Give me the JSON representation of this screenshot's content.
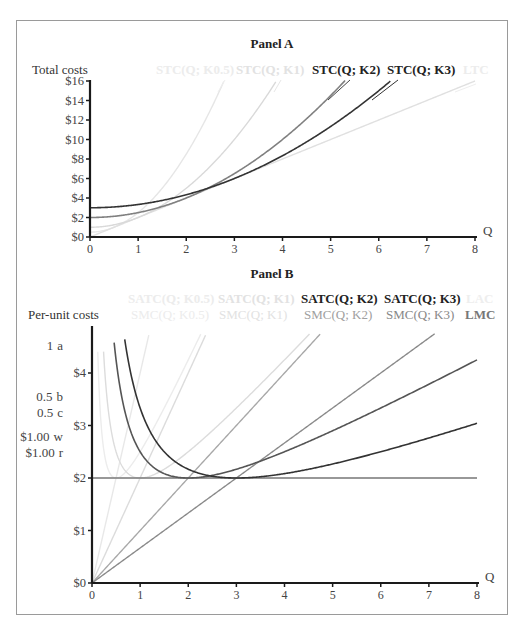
{
  "chart_data": [
    {
      "type": "line",
      "title": "Panel A",
      "ylabel": "Total costs",
      "xlabel": "Q",
      "xlim": [
        0,
        8
      ],
      "ylim": [
        0,
        16
      ],
      "x_ticks": [
        "0",
        "1",
        "2",
        "3",
        "4",
        "5",
        "6",
        "7",
        "8"
      ],
      "y_ticks": [
        "$0",
        "$2",
        "$4",
        "$6",
        "$8",
        "$10",
        "$12",
        "$14",
        "$16"
      ],
      "grid": false,
      "series": [
        {
          "name": "STC(Q; K0.5)",
          "K": 0.5,
          "formula": "K + Q^2/K",
          "color": "#e6e6e6",
          "bold": false
        },
        {
          "name": "STC(Q; K1)",
          "K": 1,
          "formula": "K + Q^2/K",
          "color": "#d9d9d9",
          "bold": false
        },
        {
          "name": "STC(Q; K2)",
          "K": 2,
          "formula": "K + Q^2/K",
          "color": "#808080",
          "bold": true
        },
        {
          "name": "STC(Q; K3)",
          "K": 3,
          "formula": "K + Q^2/K",
          "color": "#333333",
          "bold": true
        },
        {
          "name": "LTC",
          "formula": "2Q",
          "color": "#e0e0e0",
          "bold": false
        }
      ]
    },
    {
      "type": "line",
      "title": "Panel B",
      "ylabel": "Per-unit costs",
      "xlabel": "Q",
      "xlim": [
        0,
        8
      ],
      "ylim": [
        0,
        4.7
      ],
      "x_ticks": [
        "0",
        "1",
        "2",
        "3",
        "4",
        "5",
        "6",
        "7",
        "8"
      ],
      "y_ticks": [
        "$0",
        "$1",
        "$2",
        "$3",
        "$4"
      ],
      "grid": false,
      "parameters": [
        {
          "value": "1",
          "name": "a"
        },
        {
          "value": "0.5",
          "name": "b"
        },
        {
          "value": "0.5",
          "name": "c"
        },
        {
          "value": "$1.00",
          "name": "w"
        },
        {
          "value": "$1.00",
          "name": "r"
        }
      ],
      "series": [
        {
          "name": "SATC(Q; K0.5)",
          "K": 0.5,
          "formula": "K/Q + Q/K",
          "color": "#ececec",
          "bold": false
        },
        {
          "name": "SATC(Q; K1)",
          "K": 1,
          "formula": "K/Q + Q/K",
          "color": "#dcdcdc",
          "bold": false
        },
        {
          "name": "SATC(Q; K2)",
          "K": 2,
          "formula": "K/Q + Q/K",
          "color": "#555555",
          "bold": true
        },
        {
          "name": "SATC(Q; K3)",
          "K": 3,
          "formula": "K/Q + Q/K",
          "color": "#333333",
          "bold": true
        },
        {
          "name": "LAC",
          "formula": "2",
          "color": "#f0f0f0",
          "bold": false
        },
        {
          "name": "SMC(Q; K0.5)",
          "K": 0.5,
          "formula": "2Q/K",
          "color": "#e8e8e8",
          "bold": false
        },
        {
          "name": "SMC(Q; K1)",
          "K": 1,
          "formula": "2Q/K",
          "color": "#dcdcdc",
          "bold": false
        },
        {
          "name": "SMC(Q; K2)",
          "K": 2,
          "formula": "2Q/K",
          "color": "#a8a8a8",
          "bold": false
        },
        {
          "name": "SMC(Q; K3)",
          "K": 3,
          "formula": "2Q/K",
          "color": "#8a8a8a",
          "bold": false
        },
        {
          "name": "LMC",
          "formula": "2",
          "color": "#7a7a7a",
          "bold": true
        }
      ]
    }
  ],
  "panelA": {
    "title": "Panel A",
    "ylabel": "Total costs",
    "xlabel": "Q",
    "labels": [
      "STC(Q; K0.5)",
      "STC(Q; K1)",
      "STC(Q; K2)",
      "STC(Q; K3)",
      "LTC"
    ]
  },
  "panelB": {
    "title": "Panel B",
    "ylabel": "Per-unit costs",
    "xlabel": "Q",
    "labels_top": [
      "SATC(Q; K0.5)",
      "SATC(Q; K1)",
      "SATC(Q; K2)",
      "SATC(Q; K3)",
      "LAC"
    ],
    "labels_bottom": [
      "SMC(Q; K0.5)",
      "SMC(Q; K1)",
      "SMC(Q; K2)",
      "SMC(Q; K3)",
      "LMC"
    ],
    "params": [
      "1 a",
      "0.5 b",
      "0.5 c",
      "$1.00 w",
      "$1.00 r"
    ]
  }
}
